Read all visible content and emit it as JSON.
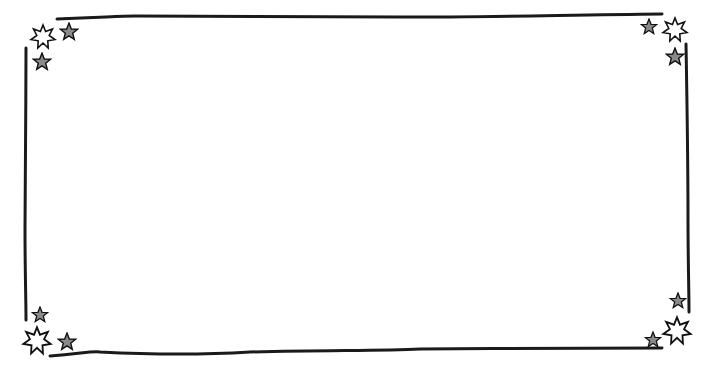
{
  "page": {
    "cropped_header_text": ""
  },
  "frame": {
    "stroke_color": "#1a1a1a",
    "star_outline_color": "#111111",
    "star_fill_gray": "#8a8a8a",
    "star_fill_white": "#ffffff",
    "corners": [
      {
        "position": "top-left",
        "stars": [
          "white-star",
          "gray-star",
          "gray-star"
        ]
      },
      {
        "position": "top-right",
        "stars": [
          "white-star",
          "gray-star",
          "gray-star"
        ]
      },
      {
        "position": "bottom-left",
        "stars": [
          "white-star",
          "gray-star",
          "gray-star"
        ]
      },
      {
        "position": "bottom-right",
        "stars": [
          "white-star",
          "gray-star",
          "gray-star"
        ]
      }
    ]
  },
  "content": {
    "interior_text": ""
  }
}
